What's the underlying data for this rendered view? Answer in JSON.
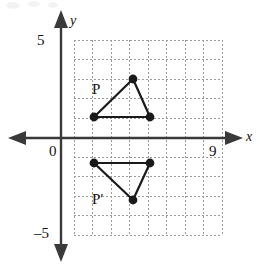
{
  "figure": {
    "kind": "coordinate-grid-reflection-diagram",
    "background": "#ffffff",
    "ink_color": "#1a1a1a",
    "grid_color": "#9a9a9a",
    "axis_color": "#3a3a3a"
  },
  "axes": {
    "x_axis_label": "x",
    "y_axis_label": "y",
    "origin_label": "0",
    "x_max_label": "9",
    "y_max_label": "5",
    "y_min_label": "–5",
    "x_range": [
      0,
      9
    ],
    "y_range": [
      -5,
      5
    ],
    "x_axis_pixel_y": 138,
    "y_axis_pixel_x": 61,
    "unit_px_x": 18.5,
    "unit_px_y": 19.5,
    "grid": {
      "left_px": 74,
      "top_px": 40,
      "right_px": 222,
      "bottom_px": 235,
      "columns": 8,
      "rows": 10,
      "style": "dotted"
    }
  },
  "labels": [
    {
      "id": "label-P",
      "text": "P",
      "x_px": 92,
      "y_px": 82
    },
    {
      "id": "label-Pprime",
      "text": "P′",
      "x_px": 92,
      "y_px": 192
    }
  ],
  "chart_data": {
    "type": "scatter",
    "title": "",
    "xlabel": "x",
    "ylabel": "y",
    "xlim": [
      0,
      9
    ],
    "ylim": [
      -5,
      5
    ],
    "grid": true,
    "legend": "none",
    "annotations": [
      {
        "text": "P",
        "x": 1.7,
        "y": 2.9
      },
      {
        "text": "P′",
        "x": 1.7,
        "y": -2.7
      }
    ],
    "series": [
      {
        "name": "Triangle P",
        "label": "P",
        "closed": true,
        "marker": "filled-circle",
        "points": [
          {
            "x": 1.8,
            "y": 1.1,
            "px": 94,
            "py": 117
          },
          {
            "x": 3.9,
            "y": 3.0,
            "px": 133,
            "py": 79
          },
          {
            "x": 4.8,
            "y": 1.1,
            "px": 150,
            "py": 117
          }
        ]
      },
      {
        "name": "Triangle P prime",
        "label": "P′",
        "closed": true,
        "marker": "filled-circle",
        "points": [
          {
            "x": 1.8,
            "y": -1.3,
            "px": 94,
            "py": 163
          },
          {
            "x": 4.8,
            "y": -1.3,
            "px": 150,
            "py": 163
          },
          {
            "x": 3.9,
            "y": -3.2,
            "px": 133,
            "py": 200
          }
        ]
      }
    ],
    "relationship": "Triangle P′ is the reflection of triangle P across the x-axis"
  }
}
